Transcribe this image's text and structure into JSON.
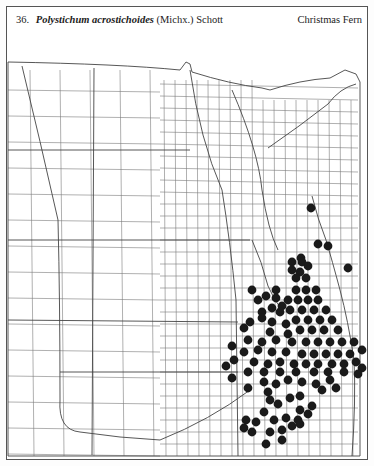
{
  "header": {
    "number": "36.",
    "scientific_name": "Polystichum acrostichoides",
    "authority": "(Michx.) Schott",
    "common_name": "Christmas Fern"
  },
  "map": {
    "type": "county dot distribution map",
    "region": "Great Plains (central United States)",
    "dot_color": "#1a1a1a",
    "line_color": "#7a7a7a",
    "dots": [
      [
        311,
        208
      ],
      [
        301,
        258
      ],
      [
        318,
        244
      ],
      [
        328,
        246
      ],
      [
        292,
        262
      ],
      [
        302,
        262
      ],
      [
        292,
        270
      ],
      [
        300,
        272
      ],
      [
        308,
        266
      ],
      [
        296,
        278
      ],
      [
        306,
        278
      ],
      [
        348,
        268
      ],
      [
        296,
        290
      ],
      [
        306,
        290
      ],
      [
        316,
        290
      ],
      [
        252,
        290
      ],
      [
        276,
        290
      ],
      [
        288,
        300
      ],
      [
        298,
        300
      ],
      [
        308,
        300
      ],
      [
        318,
        300
      ],
      [
        282,
        306
      ],
      [
        266,
        296
      ],
      [
        276,
        298
      ],
      [
        258,
        300
      ],
      [
        272,
        308
      ],
      [
        290,
        310
      ],
      [
        302,
        310
      ],
      [
        314,
        310
      ],
      [
        326,
        310
      ],
      [
        262,
        312
      ],
      [
        280,
        312
      ],
      [
        296,
        320
      ],
      [
        308,
        320
      ],
      [
        320,
        320
      ],
      [
        332,
        320
      ],
      [
        262,
        318
      ],
      [
        272,
        322
      ],
      [
        286,
        324
      ],
      [
        250,
        322
      ],
      [
        300,
        330
      ],
      [
        312,
        330
      ],
      [
        324,
        330
      ],
      [
        338,
        330
      ],
      [
        244,
        328
      ],
      [
        270,
        332
      ],
      [
        288,
        334
      ],
      [
        276,
        340
      ],
      [
        292,
        342
      ],
      [
        306,
        342
      ],
      [
        318,
        342
      ],
      [
        330,
        342
      ],
      [
        342,
        342
      ],
      [
        354,
        342
      ],
      [
        248,
        340
      ],
      [
        262,
        342
      ],
      [
        258,
        350
      ],
      [
        272,
        352
      ],
      [
        286,
        352
      ],
      [
        302,
        354
      ],
      [
        314,
        354
      ],
      [
        326,
        354
      ],
      [
        338,
        354
      ],
      [
        350,
        354
      ],
      [
        362,
        350
      ],
      [
        232,
        346
      ],
      [
        244,
        352
      ],
      [
        234,
        360
      ],
      [
        254,
        362
      ],
      [
        268,
        364
      ],
      [
        280,
        362
      ],
      [
        294,
        364
      ],
      [
        306,
        364
      ],
      [
        318,
        364
      ],
      [
        332,
        364
      ],
      [
        344,
        364
      ],
      [
        356,
        362
      ],
      [
        362,
        368
      ],
      [
        226,
        366
      ],
      [
        248,
        372
      ],
      [
        264,
        372
      ],
      [
        280,
        372
      ],
      [
        296,
        372
      ],
      [
        314,
        372
      ],
      [
        328,
        372
      ],
      [
        344,
        372
      ],
      [
        358,
        374
      ],
      [
        232,
        378
      ],
      [
        264,
        382
      ],
      [
        276,
        384
      ],
      [
        288,
        380
      ],
      [
        302,
        382
      ],
      [
        316,
        384
      ],
      [
        330,
        380
      ],
      [
        248,
        388
      ],
      [
        268,
        392
      ],
      [
        300,
        396
      ],
      [
        322,
        390
      ],
      [
        336,
        388
      ],
      [
        270,
        400
      ],
      [
        278,
        404
      ],
      [
        290,
        398
      ],
      [
        300,
        410
      ],
      [
        312,
        406
      ],
      [
        246,
        420
      ],
      [
        256,
        422
      ],
      [
        264,
        412
      ],
      [
        274,
        420
      ],
      [
        286,
        418
      ],
      [
        298,
        420
      ],
      [
        308,
        414
      ],
      [
        244,
        428
      ],
      [
        270,
        432
      ],
      [
        282,
        430
      ],
      [
        292,
        426
      ],
      [
        300,
        424
      ],
      [
        252,
        432
      ],
      [
        282,
        440
      ],
      [
        266,
        444
      ]
    ]
  }
}
